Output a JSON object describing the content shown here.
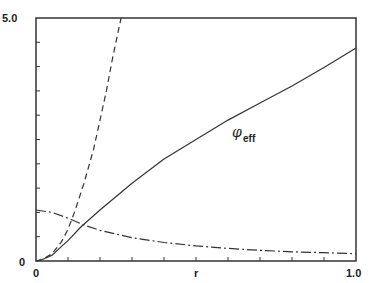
{
  "chart_data": {
    "type": "line",
    "title": "",
    "xlabel": "r",
    "ylabel": "",
    "xlim": [
      0,
      1.0
    ],
    "ylim": [
      0,
      5.0
    ],
    "grid": false,
    "legend": null,
    "x_tick_labels": [
      "0",
      "1.0"
    ],
    "y_tick_labels": [
      "0",
      "5.0"
    ],
    "x_minor_ticks": 10,
    "y_minor_ticks": 10,
    "annotations": [
      {
        "text": "φ",
        "subscript": "eff",
        "x": 0.62,
        "y": 2.3,
        "attached_series": "phi_eff"
      }
    ],
    "series": [
      {
        "name": "phi_eff",
        "style": "solid",
        "x": [
          0,
          0.02,
          0.05,
          0.08,
          0.1,
          0.14,
          0.2,
          0.3,
          0.4,
          0.5,
          0.6,
          0.7,
          0.8,
          0.9,
          1.0
        ],
        "y": [
          0,
          0.03,
          0.12,
          0.3,
          0.42,
          0.7,
          1.05,
          1.6,
          2.1,
          2.5,
          2.9,
          3.25,
          3.6,
          3.98,
          4.38
        ]
      },
      {
        "name": "dashed",
        "style": "dashed",
        "x": [
          0,
          0.02,
          0.05,
          0.08,
          0.1,
          0.12,
          0.15,
          0.18,
          0.2,
          0.22,
          0.24,
          0.266
        ],
        "y": [
          0,
          0.03,
          0.15,
          0.4,
          0.65,
          1.0,
          1.6,
          2.3,
          2.9,
          3.5,
          4.2,
          5.0
        ]
      },
      {
        "name": "dash-dot",
        "style": "dashdot",
        "x": [
          0,
          0.05,
          0.1,
          0.15,
          0.2,
          0.3,
          0.4,
          0.5,
          0.6,
          0.7,
          0.8,
          0.9,
          1.0
        ],
        "y": [
          1.05,
          1.0,
          0.88,
          0.74,
          0.63,
          0.48,
          0.38,
          0.31,
          0.26,
          0.22,
          0.19,
          0.17,
          0.15
        ]
      }
    ]
  }
}
